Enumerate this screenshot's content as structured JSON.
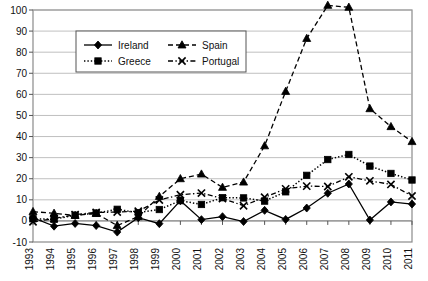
{
  "chart_data": {
    "type": "line",
    "title": "",
    "subtitle": "",
    "xlabel": "",
    "ylabel": "",
    "x": [
      1993,
      1994,
      1995,
      1996,
      1997,
      1998,
      1999,
      2000,
      2001,
      2002,
      2003,
      2004,
      2005,
      2006,
      2007,
      2008,
      2009,
      2010,
      2011
    ],
    "categories": [
      "1993",
      "1994",
      "1995",
      "1996",
      "1997",
      "1998",
      "1999",
      "2000",
      "2001",
      "2002",
      "2003",
      "2004",
      "2005",
      "2006",
      "2007",
      "2008",
      "2009",
      "2010",
      "2011"
    ],
    "xlim": [
      1993,
      2011
    ],
    "ylim": [
      -10,
      100
    ],
    "ytick_values": [
      -10,
      0,
      10,
      20,
      30,
      40,
      50,
      60,
      70,
      80,
      90,
      100
    ],
    "ytick_labels": [
      "-10",
      "0",
      "10",
      "20",
      "30",
      "40",
      "50",
      "60",
      "70",
      "80",
      "90",
      "100"
    ],
    "grid": true,
    "grid_axis": "y",
    "legend_position": "upper-left-inside",
    "series": [
      {
        "name": "Ireland",
        "marker": "diamond",
        "line_style": "solid",
        "color": "#000000",
        "values": [
          1.5,
          -2.5,
          -1.2,
          -2.2,
          -5.3,
          1.5,
          -1.3,
          9.6,
          0.6,
          2.0,
          -0.3,
          5.0,
          0.7,
          6.1,
          13.1,
          17.5,
          0.4,
          9.0,
          8.0
        ]
      },
      {
        "name": "Spain",
        "marker": "triangle",
        "line_style": "dashed",
        "color": "#000000",
        "values": [
          4.4,
          3.6,
          2.6,
          3.5,
          -2.2,
          2.0,
          11.6,
          20.0,
          22.2,
          15.9,
          18.4,
          35.6,
          61.4,
          86.5,
          102.2,
          101.3,
          53.2,
          44.7,
          37.6
        ]
      },
      {
        "name": "Greece",
        "marker": "square",
        "line_style": "dotted",
        "color": "#000000",
        "values": [
          1.0,
          0.8,
          2.7,
          3.7,
          5.5,
          3.9,
          5.4,
          9.6,
          7.8,
          11.0,
          10.9,
          9.4,
          13.8,
          21.6,
          29.1,
          31.5,
          26.0,
          22.5,
          19.4
        ]
      },
      {
        "name": "Portugal",
        "marker": "x",
        "line_style": "dash-dot",
        "color": "#000000",
        "values": [
          -0.4,
          1.1,
          3.0,
          4.0,
          4.2,
          4.6,
          9.9,
          12.4,
          13.2,
          10.6,
          7.2,
          11.2,
          15.2,
          16.5,
          16.3,
          20.9,
          19.0,
          17.3,
          11.8
        ]
      }
    ]
  },
  "legend": {
    "entries": [
      {
        "label": "Ireland"
      },
      {
        "label": "Spain"
      },
      {
        "label": "Greece"
      },
      {
        "label": "Portugal"
      }
    ]
  },
  "style": {
    "axis_color": "#8a8a8a",
    "grid_color": "#b0b0b0",
    "series_color": "#000000",
    "background": "#ffffff"
  }
}
